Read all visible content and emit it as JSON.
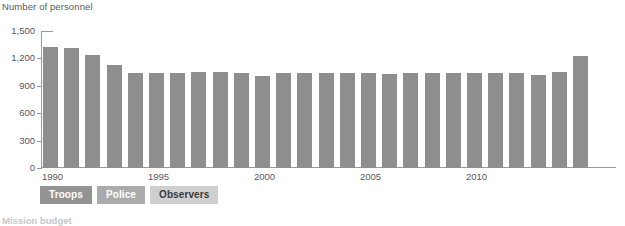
{
  "chart_data": {
    "type": "bar",
    "title": "",
    "ylabel": "Number of personnel",
    "xlabel": "",
    "ylim": [
      0,
      1500
    ],
    "grid": false,
    "legend_position": "bottom-left",
    "y_ticks": [
      "0",
      "300",
      "600",
      "900",
      "1,200",
      "1,500"
    ],
    "y_tick_values": [
      0,
      300,
      600,
      900,
      1200,
      1500
    ],
    "x_tick_labels": [
      "1990",
      "1995",
      "2000",
      "2005",
      "2010"
    ],
    "x_tick_values": [
      1990,
      1995,
      2000,
      2005,
      2010
    ],
    "categories": [
      "1990",
      "1991",
      "1992",
      "1993",
      "1994",
      "1995",
      "1996",
      "1997",
      "1998",
      "1999",
      "2000",
      "2001",
      "2002",
      "2003",
      "2004",
      "2005",
      "2006",
      "2007",
      "2008",
      "2009",
      "2010",
      "2011",
      "2012",
      "2013",
      "2014",
      "2015"
    ],
    "values": [
      1320,
      1310,
      1235,
      1125,
      1040,
      1040,
      1045,
      1050,
      1050,
      1035,
      1010,
      1040,
      1040,
      1035,
      1040,
      1040,
      1030,
      1040,
      1040,
      1040,
      1040,
      1040,
      1035,
      1020,
      1055,
      1230
    ],
    "bar_color": "#8e8e8e",
    "series": [
      {
        "name": "Observers",
        "values": [
          1320,
          1310,
          1235,
          1125,
          1040,
          1040,
          1045,
          1050,
          1050,
          1035,
          1010,
          1040,
          1040,
          1035,
          1040,
          1040,
          1030,
          1040,
          1040,
          1040,
          1040,
          1040,
          1035,
          1020,
          1055,
          1230
        ]
      }
    ]
  },
  "axis": {
    "y_title": "Number of personnel"
  },
  "legend": {
    "items": [
      {
        "label": "Troops",
        "color": "#939393",
        "active": false
      },
      {
        "label": "Police",
        "color": "#ababab",
        "active": false
      },
      {
        "label": "Observers",
        "color": "#cfcfcf",
        "active": true
      }
    ]
  },
  "footer": {
    "heading": "Mission budget"
  }
}
